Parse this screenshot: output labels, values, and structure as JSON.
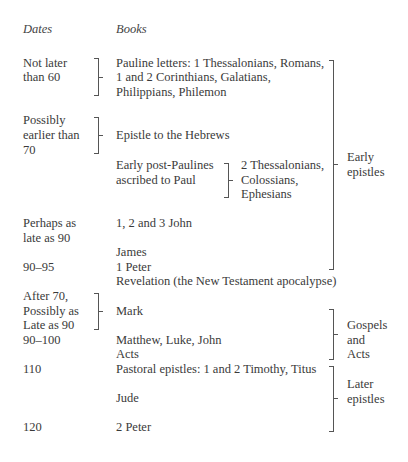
{
  "headers": {
    "dates": "Dates",
    "books": "Books"
  },
  "dates": {
    "d1": [
      "Not later",
      "than 60"
    ],
    "d2": [
      "Possibly",
      "earlier than",
      "70"
    ],
    "d3": [
      "Perhaps as",
      "late as 90"
    ],
    "d4": "90–95",
    "d5": [
      "After 70,",
      "Possibly as",
      "Late as 90"
    ],
    "d6": "90–100",
    "d7": "110",
    "d8": "120"
  },
  "books": {
    "pauline": [
      "Pauline letters: 1 Thessalonians, Romans,",
      "1 and 2 Corinthians, Galatians,",
      "Philippians, Philemon"
    ],
    "hebrews": "Epistle to the Hebrews",
    "post_pauline_label": [
      "Early post-Paulines",
      "ascribed to Paul"
    ],
    "post_pauline_books": [
      "2 Thessalonians,",
      "Colossians,",
      "Ephesians"
    ],
    "john_letters": "1, 2 and 3 John",
    "james": "James",
    "peter1": "1 Peter",
    "revelation": "Revelation (the New Testament apocalypse)",
    "mark": "Mark",
    "gospels": "Matthew, Luke, John",
    "acts": "Acts",
    "pastoral": "Pastoral epistles: 1 and 2 Timothy, Titus",
    "jude": "Jude",
    "peter2": "2 Peter"
  },
  "groups": {
    "early": [
      "Early",
      "epistles"
    ],
    "gospels": [
      "Gospels",
      "and",
      "Acts"
    ],
    "later": [
      "Later",
      "epistles"
    ]
  }
}
